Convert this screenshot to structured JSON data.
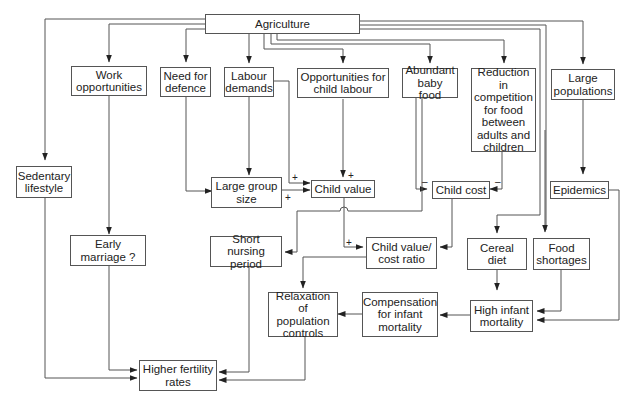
{
  "diagram": {
    "nodes": {
      "agriculture": "Agriculture",
      "work_opportunities": "Work\nopportunities",
      "need_for_defence": "Need for\ndefence",
      "labour_demands": "Labour\ndemands",
      "child_labour": "Opportunities for\nchild labour",
      "baby_food": "Abundant\nbaby food",
      "reduction_competition": "Reduction in\ncompetition\nfor food\nbetween\nadults and\nchildren",
      "large_populations": "Large\npopulations",
      "sedentary": "Sedentary\nlifestyle",
      "large_group": "Large group\nsize",
      "child_value": "Child value",
      "child_cost": "Child cost",
      "epidemics": "Epidemics",
      "early_marriage": "Early\nmarriage ?",
      "short_nursing": "Short nursing\nperiod",
      "value_cost_ratio": "Child value/\ncost ratio",
      "cereal_diet": "Cereal\ndiet",
      "food_shortages": "Food\nshortages",
      "relaxation": "Relaxation of\npopulation\ncontrols",
      "compensation": "Compensation\nfor infant\nmortality",
      "high_infant_mortality": "High infant\nmortality",
      "higher_fertility": "Higher fertility\nrates"
    },
    "signs": {
      "plus": "+",
      "minus": "–"
    },
    "edges": [
      {
        "from": "Agriculture",
        "to": "Work opportunities"
      },
      {
        "from": "Agriculture",
        "to": "Need for defence"
      },
      {
        "from": "Agriculture",
        "to": "Labour demands"
      },
      {
        "from": "Agriculture",
        "to": "Opportunities for child labour"
      },
      {
        "from": "Agriculture",
        "to": "Abundant baby food"
      },
      {
        "from": "Agriculture",
        "to": "Reduction in competition for food between adults and children"
      },
      {
        "from": "Agriculture",
        "to": "Large populations"
      },
      {
        "from": "Agriculture",
        "to": "Sedentary lifestyle"
      },
      {
        "from": "Agriculture",
        "to": "Cereal diet"
      },
      {
        "from": "Agriculture",
        "to": "Food shortages"
      },
      {
        "from": "Work opportunities",
        "to": "Early marriage ?"
      },
      {
        "from": "Need for defence",
        "to": "Large group size"
      },
      {
        "from": "Labour demands",
        "to": "Large group size"
      },
      {
        "from": "Labour demands",
        "to": "Child value",
        "sign": "+"
      },
      {
        "from": "Large group size",
        "to": "Child value",
        "sign": "+"
      },
      {
        "from": "Opportunities for child labour",
        "to": "Child value",
        "sign": "+"
      },
      {
        "from": "Abundant baby food",
        "to": "Child cost",
        "sign": "-"
      },
      {
        "from": "Abundant baby food",
        "to": "Short nursing period"
      },
      {
        "from": "Reduction in competition",
        "to": "Child cost",
        "sign": "-"
      },
      {
        "from": "Child value",
        "to": "Child value/cost ratio",
        "sign": "+"
      },
      {
        "from": "Child cost",
        "to": "Child value/cost ratio"
      },
      {
        "from": "Child value/cost ratio",
        "to": "Relaxation of population controls"
      },
      {
        "from": "Large populations",
        "to": "Epidemics"
      },
      {
        "from": "Epidemics",
        "to": "High infant mortality"
      },
      {
        "from": "Cereal diet",
        "to": "High infant mortality"
      },
      {
        "from": "Food shortages",
        "to": "High infant mortality"
      },
      {
        "from": "High infant mortality",
        "to": "Compensation for infant mortality"
      },
      {
        "from": "Compensation for infant mortality",
        "to": "Relaxation of population controls"
      },
      {
        "from": "Sedentary lifestyle",
        "to": "Higher fertility rates"
      },
      {
        "from": "Early marriage ?",
        "to": "Higher fertility rates"
      },
      {
        "from": "Short nursing period",
        "to": "Higher fertility rates"
      },
      {
        "from": "Relaxation of population controls",
        "to": "Higher fertility rates"
      }
    ]
  }
}
